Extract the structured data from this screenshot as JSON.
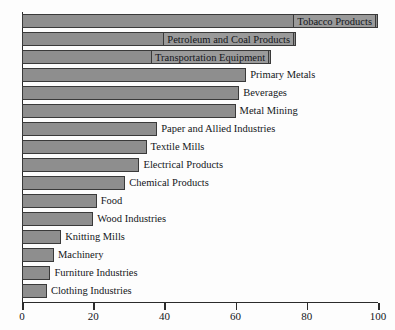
{
  "chart_data": {
    "type": "bar",
    "orientation": "horizontal",
    "title": "",
    "xlabel": "",
    "ylabel": "",
    "xlim": [
      0,
      100
    ],
    "grid": false,
    "legend": false,
    "xticks": [
      "0",
      "20",
      "40",
      "60",
      "80",
      "100"
    ],
    "xtick_values": [
      0,
      20,
      40,
      60,
      80,
      100
    ],
    "categories": [
      "Tobacco Products",
      "Petroleum and Coal Products",
      "Transportation Equipment",
      "Primary Metals",
      "Beverages",
      "Metal Mining",
      "Paper and Allied Industries",
      "Textile Mills",
      "Electrical Products",
      "Chemical Products",
      "Food",
      "Wood Industries",
      "Knitting Mills",
      "Machinery",
      "Furniture Industries",
      "Clothing Industries"
    ],
    "values": [
      100,
      77,
      70,
      63,
      61,
      60,
      38,
      35,
      33,
      29,
      21,
      20,
      11,
      9,
      8,
      7
    ],
    "label_placement": [
      "inside",
      "inside",
      "inside",
      "outside",
      "outside",
      "outside",
      "outside",
      "outside",
      "outside",
      "outside",
      "outside",
      "outside",
      "outside",
      "outside",
      "outside",
      "outside"
    ],
    "bar_color": "#8e8e8e",
    "bar_edge_color": "#3a3a3a",
    "axis_color": "#2b2b2b"
  }
}
